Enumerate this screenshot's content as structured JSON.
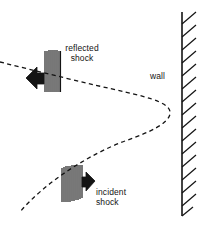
{
  "figure": {
    "background_color": "#ffffff",
    "ink_color": "#141414",
    "width": 201,
    "height": 228
  },
  "labels": {
    "reflected_shock_line1": "reflected",
    "reflected_shock_line2": "shock",
    "incident_shock_line1": "incident",
    "incident_shock_line2": "shock",
    "wall": "wall"
  },
  "elements": {
    "wall_name": "wall",
    "incident_shock_name": "incident shock",
    "reflected_shock_name": "reflected shock",
    "shock_trajectory_name": "dashed shock trajectory",
    "incident_arrow_direction": "right",
    "reflected_arrow_direction": "left"
  },
  "geometry": {
    "wall_line_x": 182,
    "wall_top_y": 12,
    "wall_bottom_y": 216,
    "wall_hatch_count": 16,
    "curve_apex_x": 170,
    "curve_apex_y": 113,
    "upper_branch_start": [
      0,
      62
    ],
    "lower_branch_end": [
      20,
      212
    ],
    "reflected_band": [
      44,
      50,
      17,
      43
    ],
    "incident_band": [
      61,
      165,
      22,
      38
    ],
    "reflected_band_stripe_count": 9,
    "incident_band_stripe_count": 10
  }
}
